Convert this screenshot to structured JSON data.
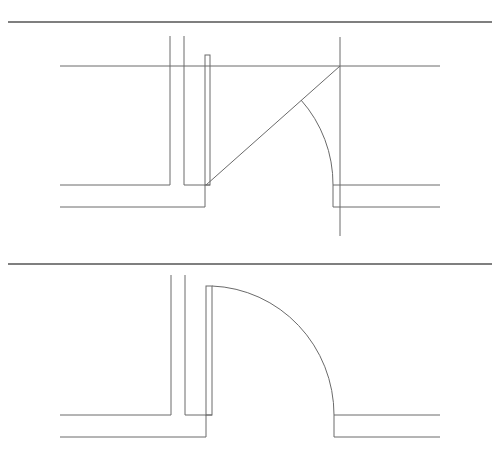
{
  "diagram": {
    "panels": [
      {
        "id": "construction",
        "description": "Door opening with swing construction lines: diagonal from hinge to wall line and partial swing arc",
        "elements": [
          "separator-line",
          "wall-lines",
          "door-leaf",
          "construction-diagonal",
          "partial-swing-arc",
          "reference-vertical"
        ]
      },
      {
        "id": "final",
        "description": "Completed door plan symbol with quarter-circle swing arc",
        "elements": [
          "separator-line",
          "wall-lines",
          "door-leaf",
          "swing-arc"
        ]
      }
    ],
    "colors": {
      "line": "#6a6a6a",
      "separator": "#555555",
      "background": "#ffffff"
    }
  }
}
